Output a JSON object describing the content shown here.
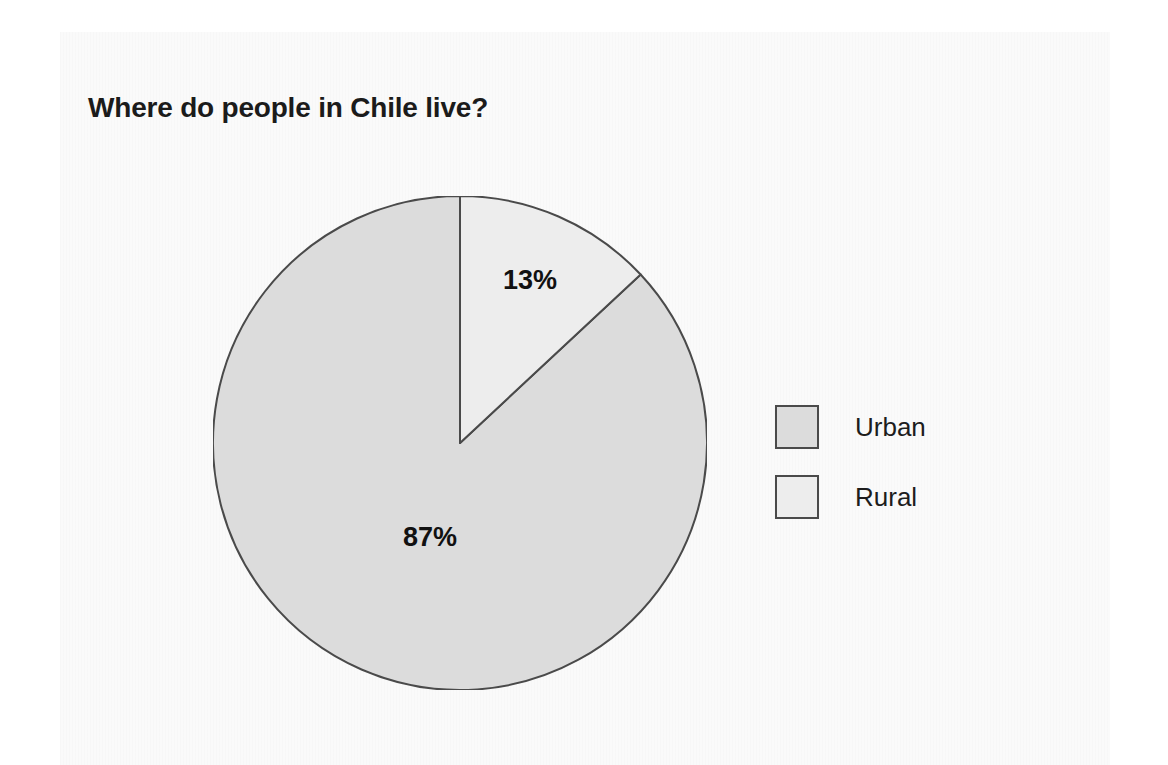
{
  "figure": {
    "title": "Where do people in Chile live?",
    "background_color": "#fafafa",
    "page_color": "#ffffff"
  },
  "chart_data": {
    "type": "pie",
    "title": "Where do people in Chile live?",
    "xlabel": "",
    "ylabel": "",
    "units": "percent",
    "start_angle_deg": 0,
    "direction": "clockwise",
    "legend_position": "right",
    "grid": false,
    "categories": [
      "Urban",
      "Rural"
    ],
    "values": [
      87,
      13
    ],
    "slices": [
      {
        "label": "Urban",
        "value": 87,
        "value_text": "87%",
        "color": "#dcdcdc",
        "edge_color": "#4a4a4a",
        "start_angle_deg": 47,
        "end_angle_deg": 360
      },
      {
        "label": "Rural",
        "value": 13,
        "value_text": "13%",
        "color": "#ededed",
        "edge_color": "#4a4a4a",
        "start_angle_deg": 0,
        "end_angle_deg": 47
      }
    ],
    "data_labels": [
      "13%",
      "87%"
    ],
    "legend": [
      {
        "label": "Urban",
        "color": "#dcdcdc"
      },
      {
        "label": "Rural",
        "color": "#ededed"
      }
    ]
  },
  "labels": {
    "rural_pct": "13%",
    "urban_pct": "87%"
  },
  "legend": {
    "items": [
      {
        "label": "Urban",
        "color": "#dcdcdc",
        "border": "#4a4a4a"
      },
      {
        "label": "Rural",
        "color": "#ededed",
        "border": "#4a4a4a"
      }
    ]
  }
}
